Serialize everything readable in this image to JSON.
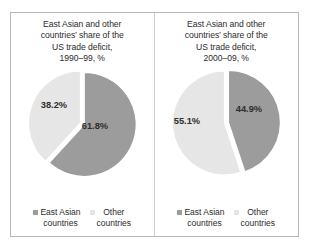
{
  "figure": {
    "frame_color": "#b9b9b9",
    "divider_color": "#cfcfcf",
    "background": "#ffffff"
  },
  "colors": {
    "east_asian": "#9c9c9c",
    "other": "#e6e6e6",
    "text": "#2b2b2b",
    "slice_gap": "#ffffff"
  },
  "legend": {
    "items": [
      {
        "label_line1": "East Asian",
        "label_line2": "countries",
        "color": "#9c9c9c",
        "marker": "square-marker"
      },
      {
        "label_line1": "Other",
        "label_line2": "countries",
        "color": "#e6e6e6",
        "marker": "square-marker"
      }
    ]
  },
  "panels": [
    {
      "title": "East Asian and other countries’ share of the US trade deficit, 1990–99, %",
      "title_lines": [
        "East Asian and other",
        "countries’ share of the",
        "US trade deficit,",
        "1990–99, %"
      ],
      "labels": {
        "east_asian": "61.8%",
        "other": "38.2%"
      }
    },
    {
      "title": "East Asian and other countries’ share of the US trade deficit, 2000–09, %",
      "title_lines": [
        "East Asian and other",
        "countries’ share of the",
        "US trade deficit,",
        "2000–09, %"
      ],
      "labels": {
        "east_asian": "44.9%",
        "other": "55.1%"
      }
    }
  ],
  "chart_data": [
    {
      "type": "pie",
      "title": "East Asian and other countries’ share of the US trade deficit, 1990–99, %",
      "categories": [
        "East Asian countries",
        "Other countries"
      ],
      "values": [
        61.8,
        38.2
      ],
      "data_labels": [
        "61.8%",
        "38.2%"
      ],
      "colors": [
        "#9c9c9c",
        "#e6e6e6"
      ],
      "start_angle_deg": 0,
      "direction": "clockwise",
      "legend_position": "bottom",
      "units": "%"
    },
    {
      "type": "pie",
      "title": "East Asian and other countries’ share of the US trade deficit, 2000–09, %",
      "categories": [
        "East Asian countries",
        "Other countries"
      ],
      "values": [
        44.9,
        55.1
      ],
      "data_labels": [
        "44.9%",
        "55.1%"
      ],
      "colors": [
        "#9c9c9c",
        "#e6e6e6"
      ],
      "start_angle_deg": 0,
      "direction": "clockwise",
      "legend_position": "bottom",
      "units": "%"
    }
  ]
}
